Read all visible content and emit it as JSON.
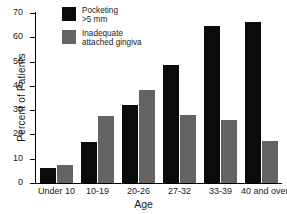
{
  "chart_data": {
    "type": "bar",
    "title": "",
    "xlabel": "Age",
    "ylabel": "Percent of Patients",
    "ylim": [
      0,
      70
    ],
    "yticks": [
      0,
      10,
      20,
      30,
      40,
      50,
      60,
      70
    ],
    "grid": false,
    "legend_position": "top-left",
    "categories": [
      "Under 10",
      "10-19",
      "20-26",
      "27-32",
      "33-39",
      "40 and over"
    ],
    "series": [
      {
        "name": "Pocketing >5 mm",
        "color": "#0b0b0b",
        "values": [
          6,
          17,
          32,
          48.5,
          64.5,
          66.5
        ]
      },
      {
        "name": "Inadequate attached gingiva",
        "color": "#636363",
        "values": [
          7.5,
          27.5,
          38.5,
          28,
          26,
          17.5
        ]
      }
    ]
  },
  "legend": {
    "items": [
      {
        "line1": "Pocketing",
        "line2": ">5 mm",
        "swatch": "black"
      },
      {
        "line1": "Inadequate",
        "line2": "attached gingiva",
        "swatch": "gray"
      }
    ]
  }
}
